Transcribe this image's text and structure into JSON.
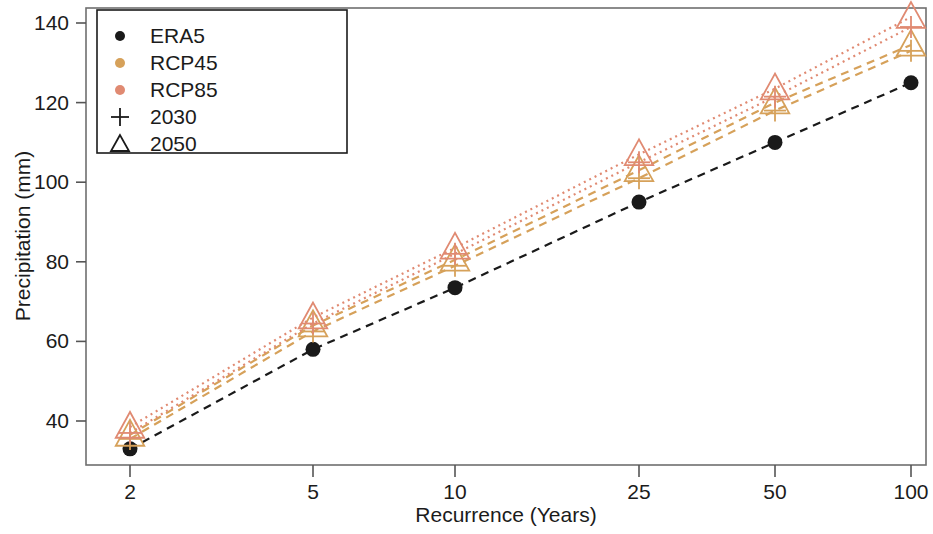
{
  "chart_data": {
    "type": "line",
    "title": "",
    "xlabel": "Recurrence (Years)",
    "ylabel": "Precipitation (mm)",
    "x": [
      2,
      5,
      10,
      25,
      50,
      100
    ],
    "xtick_labels": [
      "2",
      "5",
      "10",
      "25",
      "50",
      "100"
    ],
    "ytick_labels": [
      "40",
      "60",
      "80",
      "100",
      "120",
      "140"
    ],
    "ytick_values": [
      40,
      60,
      80,
      100,
      120,
      140
    ],
    "ylim": [
      30,
      146
    ],
    "xscale": "log-like-categorical",
    "grid": false,
    "legend_position": "upper left",
    "series": [
      {
        "name": "ERA5",
        "scenario": "ERA5",
        "period": "",
        "color": "#1a1a1a",
        "marker": "circle",
        "linestyle": "dashed",
        "values": [
          33,
          58,
          73.5,
          95,
          110,
          125
        ]
      },
      {
        "name": "RCP45 2030",
        "scenario": "RCP45",
        "period": "2030",
        "color": "#d6a15a",
        "marker": "plus",
        "linestyle": "dashed",
        "values": [
          35.5,
          62.5,
          79,
          101,
          118,
          133
        ]
      },
      {
        "name": "RCP45 2050",
        "scenario": "RCP45",
        "period": "2050",
        "color": "#d6a15a",
        "marker": "triangle",
        "linestyle": "dashed",
        "values": [
          36.5,
          64,
          80.5,
          103,
          120,
          134.5
        ]
      },
      {
        "name": "RCP85 2030",
        "scenario": "RCP85",
        "period": "2030",
        "color": "#e08a72",
        "marker": "plus",
        "linestyle": "dotted",
        "values": [
          37,
          64.5,
          82,
          105,
          121.5,
          139
        ]
      },
      {
        "name": "RCP85 2050",
        "scenario": "RCP85",
        "period": "2050",
        "color": "#e08a72",
        "marker": "triangle",
        "linestyle": "dotted",
        "values": [
          38.5,
          66,
          83.5,
          107,
          123.5,
          141.5
        ]
      }
    ],
    "legend_entries": [
      {
        "label": "ERA5",
        "marker": "dot",
        "color": "#1a1a1a"
      },
      {
        "label": "RCP45",
        "marker": "dot",
        "color": "#d6a15a"
      },
      {
        "label": "RCP85",
        "marker": "dot",
        "color": "#e08a72"
      },
      {
        "label": "2030",
        "marker": "plus",
        "color": "#1a1a1a"
      },
      {
        "label": "2050",
        "marker": "triangle",
        "color": "#1a1a1a"
      }
    ]
  },
  "colors": {
    "era5": "#1a1a1a",
    "rcp45": "#d6a15a",
    "rcp85": "#e08a72",
    "axis": "#555555",
    "text": "#1b1b1b"
  }
}
